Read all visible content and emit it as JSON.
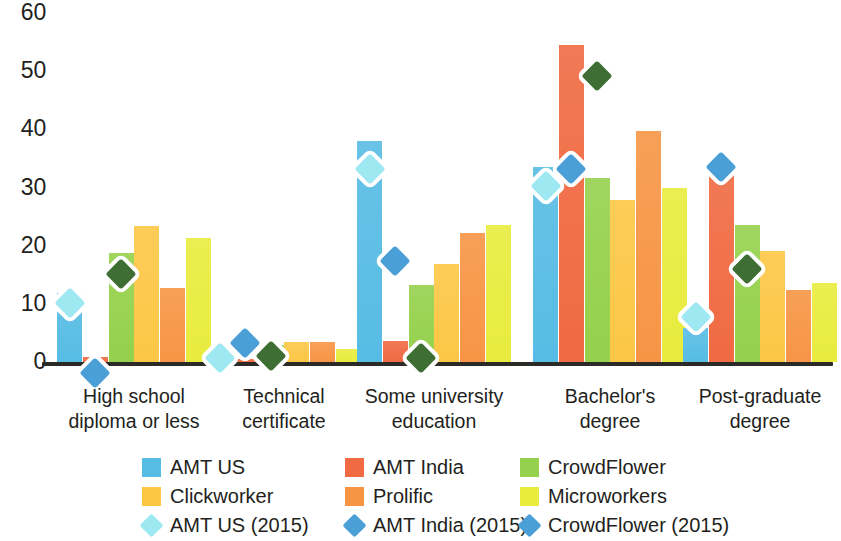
{
  "chart_data": {
    "type": "bar",
    "title": "",
    "xlabel": "",
    "ylabel": "",
    "ylim": [
      0,
      60
    ],
    "yticks": [
      0,
      10,
      20,
      30,
      40,
      50,
      60
    ],
    "grid": false,
    "legend_position": "bottom",
    "categories": [
      "High school diploma or less",
      "Technical certificate",
      "Some university education",
      "Bachelor's degree",
      "Post-graduate degree"
    ],
    "category_lines": [
      [
        "High school",
        "diploma or less"
      ],
      [
        "Technical",
        "certificate"
      ],
      [
        "Some university",
        "education"
      ],
      [
        "Bachelor's",
        "degree"
      ],
      [
        "Post-graduate",
        "degree"
      ]
    ],
    "series": [
      {
        "name": "AMT US",
        "color": "#57bce4",
        "values": [
          11.8,
          1.7,
          38.0,
          33.6,
          5.8
        ]
      },
      {
        "name": "AMT India",
        "color": "#f06a42",
        "values": [
          0.8,
          0.6,
          3.6,
          54.5,
          32.4
        ]
      },
      {
        "name": "CrowdFlower",
        "color": "#95d14c",
        "values": [
          18.8,
          3.0,
          13.3,
          31.6,
          23.6
        ]
      },
      {
        "name": "Clickworker",
        "color": "#fcc745",
        "values": [
          23.4,
          3.4,
          16.8,
          27.9,
          19.0
        ]
      },
      {
        "name": "Prolific",
        "color": "#f79545",
        "values": [
          12.7,
          3.4,
          22.2,
          39.8,
          12.4
        ]
      },
      {
        "name": "Microworkers",
        "color": "#e9ec3d",
        "values": [
          21.4,
          2.3,
          23.6,
          30.0,
          13.6
        ]
      }
    ],
    "marker_series": [
      {
        "name": "AMT US (2015)",
        "color": "#9ee8f2",
        "marker": "diamond",
        "values": [
          12.1,
          2.6,
          35.0,
          32.2,
          9.7
        ]
      },
      {
        "name": "AMT India (2015)",
        "color": "#4b9fd7",
        "marker": "diamond",
        "values": [
          0.0,
          5.2,
          19.3,
          35.0,
          35.5
        ]
      },
      {
        "name": "CrowdFlower (2015)",
        "color": "#3e6e33",
        "marker": "diamond",
        "values": [
          17.0,
          3.0,
          2.5,
          51.0,
          17.8
        ]
      }
    ]
  },
  "axis": {
    "y_tick_labels": [
      "60",
      "50",
      "40",
      "30",
      "20",
      "10",
      "0"
    ]
  },
  "legend": {
    "entries": [
      {
        "label": "AMT US",
        "color": "#57bce4",
        "marker": "square",
        "name": "legend-amt-us"
      },
      {
        "label": "AMT India",
        "color": "#f06a42",
        "marker": "square",
        "name": "legend-amt-india"
      },
      {
        "label": "CrowdFlower",
        "color": "#95d14c",
        "marker": "square",
        "name": "legend-crowdflower"
      },
      {
        "label": "Clickworker",
        "color": "#fcc745",
        "marker": "square",
        "name": "legend-clickworker"
      },
      {
        "label": "Prolific",
        "color": "#f79545",
        "marker": "square",
        "name": "legend-prolific"
      },
      {
        "label": "Microworkers",
        "color": "#e9ec3d",
        "marker": "square",
        "name": "legend-microworkers"
      },
      {
        "label": "AMT US (2015)",
        "color": "#9ee8f2",
        "marker": "diamond",
        "name": "legend-amt-us-2015"
      },
      {
        "label": "AMT India (2015)",
        "color": "#4b9fd7",
        "marker": "diamond",
        "name": "legend-amt-india-2015"
      },
      {
        "label": "CrowdFlower (2015)",
        "color": "#4b9fd7",
        "marker": "diamond",
        "name": "legend-crowdflower-2015"
      }
    ]
  }
}
